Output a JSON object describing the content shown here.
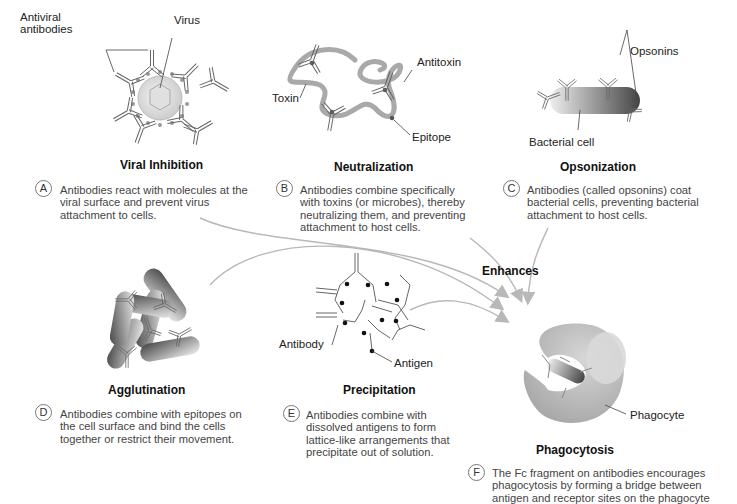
{
  "panels": {
    "viral_inhibition": {
      "letter": "A",
      "title": "Viral Inhibition",
      "labels": {
        "antibodies": "Antiviral\nantibodies",
        "antibodies_line1": "Antiviral",
        "antibodies_line2": "antibodies",
        "virus": "Virus"
      },
      "description": "Antibodies react with molecules at the viral surface and prevent virus attachment to cells."
    },
    "neutralization": {
      "letter": "B",
      "title": "Neutralization",
      "labels": {
        "toxin": "Toxin",
        "antitoxin": "Antitoxin",
        "epitope": "Epitope"
      },
      "description": "Antibodies combine specifically with toxins (or microbes), thereby neutralizing them, and preventing attachment to host cells."
    },
    "opsonization": {
      "letter": "C",
      "title": "Opsonization",
      "labels": {
        "opsonins": "Opsonins",
        "bacterial_cell": "Bacterial cell"
      },
      "description": "Antibodies (called opsonins) coat bacterial cells, preventing bacterial attachment to host cells."
    },
    "agglutination": {
      "letter": "D",
      "title": "Agglutination",
      "description": "Antibodies combine with epitopes on the cell surface and bind the cells together or restrict their movement."
    },
    "precipitation": {
      "letter": "E",
      "title": "Precipitation",
      "labels": {
        "antibody": "Antibody",
        "antigen": "Antigen"
      },
      "description": "Antibodies combine with dissolved antigens to form lattice-like arrangements that precipitate out of solution."
    },
    "phagocytosis": {
      "letter": "F",
      "title": "Phagocytosis",
      "labels": {
        "phagocyte": "Phagocyte"
      },
      "description": "The Fc fragment on antibodies encourages phagocytosis by forming a bridge between antigen and receptor sites on the phagocyte"
    }
  },
  "arrows": {
    "label": "Enhances"
  },
  "colors": {
    "arrow": "#b8b8b8",
    "toxin": "#a9a9a9",
    "antibody_stroke": "#666666",
    "cell_light": "#e6e6e6",
    "cell_dark": "#555555",
    "phagocyte": "#bdbdbd"
  }
}
